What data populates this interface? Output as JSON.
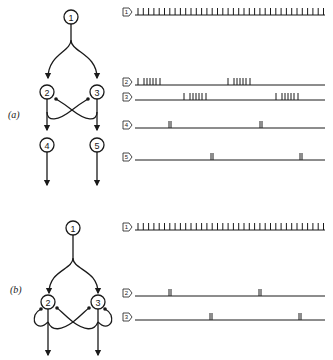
{
  "figure": {
    "panels": [
      {
        "label": "(a)",
        "nodes": [
          {
            "id": "1",
            "label": "1"
          },
          {
            "id": "2",
            "label": "2"
          },
          {
            "id": "3",
            "label": "3"
          },
          {
            "id": "4",
            "label": "4"
          },
          {
            "id": "5",
            "label": "5"
          }
        ],
        "connections": [
          {
            "from": "1",
            "to": "2",
            "type": "excitatory"
          },
          {
            "from": "1",
            "to": "3",
            "type": "excitatory"
          },
          {
            "from": "2",
            "to": "4",
            "type": "excitatory"
          },
          {
            "from": "3",
            "to": "5",
            "type": "excitatory"
          },
          {
            "from": "2",
            "to": "3",
            "type": "inhibitory",
            "via": "crossed collateral"
          },
          {
            "from": "3",
            "to": "2",
            "type": "inhibitory",
            "via": "crossed collateral"
          }
        ],
        "traces": [
          {
            "tag": "1",
            "pattern": "regular continuous spike train"
          },
          {
            "tag": "2",
            "pattern": "alternating bursts (phase A)"
          },
          {
            "tag": "3",
            "pattern": "alternating bursts (phase B)"
          },
          {
            "tag": "4",
            "pattern": "single doublet per cycle (phase A)"
          },
          {
            "tag": "5",
            "pattern": "single doublet per cycle (phase B)"
          }
        ]
      },
      {
        "label": "(b)",
        "nodes": [
          {
            "id": "1",
            "label": "1"
          },
          {
            "id": "2",
            "label": "2"
          },
          {
            "id": "3",
            "label": "3"
          }
        ],
        "connections": [
          {
            "from": "1",
            "to": "2",
            "type": "excitatory"
          },
          {
            "from": "1",
            "to": "3",
            "type": "excitatory"
          },
          {
            "from": "2",
            "to": "2",
            "type": "inhibitory",
            "via": "recurrent collateral"
          },
          {
            "from": "3",
            "to": "3",
            "type": "inhibitory",
            "via": "recurrent collateral"
          },
          {
            "from": "2",
            "to": "3",
            "type": "inhibitory",
            "via": "crossed collateral"
          },
          {
            "from": "3",
            "to": "2",
            "type": "inhibitory",
            "via": "crossed collateral"
          }
        ],
        "traces": [
          {
            "tag": "1",
            "pattern": "regular continuous spike train"
          },
          {
            "tag": "2",
            "pattern": "single doublet per cycle (phase A)"
          },
          {
            "tag": "3",
            "pattern": "single doublet per cycle (phase B)"
          }
        ]
      }
    ]
  }
}
